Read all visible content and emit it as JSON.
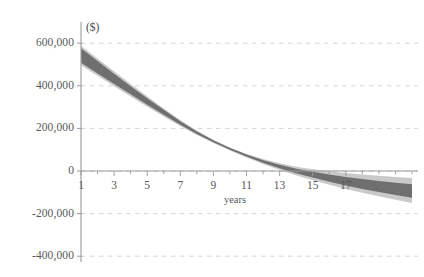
{
  "chart_data": {
    "type": "area",
    "title": "",
    "subtitle": "",
    "xlabel": "years",
    "ylabel": "($)",
    "unit_label": "($)",
    "xlim": [
      1,
      21
    ],
    "ylim": [
      -400000,
      650000
    ],
    "grid": true,
    "legend": null,
    "y_ticks": [
      {
        "value": 600000,
        "label": "600,000"
      },
      {
        "value": 400000,
        "label": "400,000"
      },
      {
        "value": 200000,
        "label": "200,000"
      },
      {
        "value": 0,
        "label": "0"
      },
      {
        "value": -200000,
        "label": "-200,000"
      },
      {
        "value": -400000,
        "label": "-400,000"
      }
    ],
    "x_ticks": [
      {
        "value": 1,
        "label": "1"
      },
      {
        "value": 3,
        "label": "3"
      },
      {
        "value": 5,
        "label": "5"
      },
      {
        "value": 7,
        "label": "7"
      },
      {
        "value": 9,
        "label": "9"
      },
      {
        "value": 11,
        "label": "11"
      },
      {
        "value": 13,
        "label": "13"
      },
      {
        "value": 15,
        "label": "15"
      },
      {
        "value": 17,
        "label": "17"
      }
    ],
    "x_minor_ticks": [
      2,
      4,
      6,
      8,
      10,
      12,
      14,
      16,
      18,
      19,
      20,
      21
    ],
    "x": [
      1,
      2,
      3,
      4,
      5,
      6,
      7,
      8,
      9,
      10,
      11,
      12,
      13,
      14,
      15,
      16,
      17,
      18,
      19,
      20,
      21
    ],
    "series": [
      {
        "name": "outer-band-upper",
        "role": "outer_band_upper",
        "color": "#c9c9c9",
        "values": [
          588000,
          528000,
          468000,
          409000,
          351000,
          294000,
          240000,
          190000,
          146000,
          110000,
          80000,
          56000,
          36000,
          20000,
          8000,
          -1000,
          -9000,
          -16000,
          -22000,
          -28000,
          -33000
        ]
      },
      {
        "name": "inner-band-upper",
        "role": "inner_band_upper",
        "color": "#6f6f6f",
        "values": [
          576000,
          516000,
          456000,
          398000,
          342000,
          287000,
          234000,
          186000,
          144000,
          108000,
          77000,
          51000,
          29000,
          11000,
          -4000,
          -17000,
          -28000,
          -38000,
          -47000,
          -55000,
          -62000
        ]
      },
      {
        "name": "inner-band-lower",
        "role": "inner_band_lower",
        "color": "#6f6f6f",
        "values": [
          508000,
          458000,
          409000,
          360000,
          311000,
          264000,
          217000,
          174000,
          135000,
          100000,
          68000,
          39000,
          13000,
          -10000,
          -31000,
          -50000,
          -68000,
          -84000,
          -99000,
          -113000,
          -126000
        ]
      },
      {
        "name": "outer-band-lower",
        "role": "outer_band_lower",
        "color": "#c9c9c9",
        "values": [
          496000,
          447000,
          398000,
          350000,
          302000,
          256000,
          211000,
          169000,
          131000,
          96000,
          63000,
          33000,
          5000,
          -20000,
          -43000,
          -64000,
          -84000,
          -102000,
          -119000,
          -135000,
          -150000
        ]
      }
    ],
    "colors": {
      "outer_band": "#c9c9c9",
      "inner_band": "#6f6f6f",
      "grid": "#cfcfd4",
      "axis": "#9a9a9e",
      "text": "#58585a",
      "background": "#ffffff"
    }
  }
}
